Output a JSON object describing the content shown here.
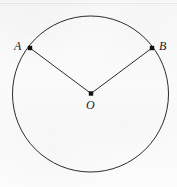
{
  "figure": {
    "type": "geometry-diagram",
    "canvas": {
      "width": 177,
      "height": 187
    },
    "background_color": "#fafafa",
    "stroke_color": "#2b2b2b",
    "point_color": "#111111",
    "circle": {
      "name": "circle-outline",
      "center_x": 90.5,
      "center_y": 94,
      "radius": 78,
      "stroke_width": 1
    },
    "points": [
      {
        "id": "A",
        "label": "A",
        "x": 30,
        "y": 48,
        "label_x": 14,
        "label_y": 40,
        "marker_size": 4.4
      },
      {
        "id": "B",
        "label": "B",
        "x": 152,
        "y": 48,
        "label_x": 159,
        "label_y": 40,
        "marker_size": 4.4
      },
      {
        "id": "O",
        "label": "O",
        "x": 91,
        "y": 93.5,
        "label_x": 86,
        "label_y": 99,
        "marker_size": 4.4
      }
    ],
    "segments": [
      {
        "id": "OA",
        "name": "radius-segment-oa",
        "from": "O",
        "to": "A",
        "x1": 91,
        "y1": 93.5,
        "x2": 30,
        "y2": 48,
        "stroke_width": 1
      },
      {
        "id": "OB",
        "name": "radius-segment-ob",
        "from": "O",
        "to": "B",
        "x1": 91,
        "y1": 93.5,
        "x2": 152,
        "y2": 48,
        "stroke_width": 1
      }
    ]
  }
}
